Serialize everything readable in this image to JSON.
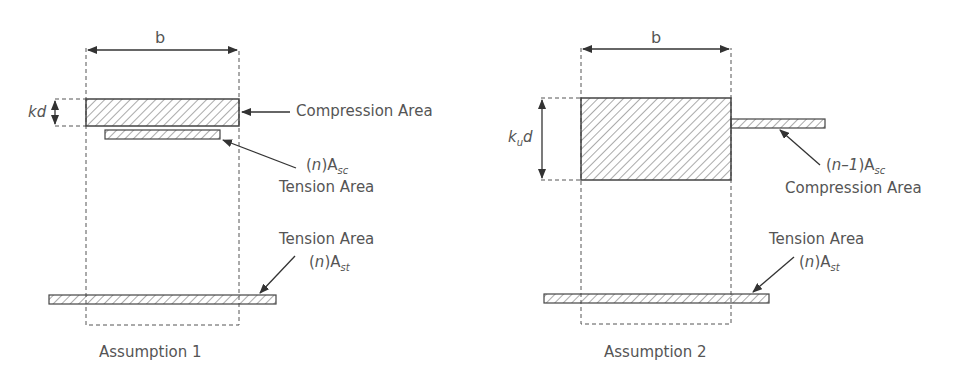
{
  "diagrams": [
    {
      "id": "assumption-1",
      "caption": "Assumption 1",
      "width_label": "b",
      "depth_label": {
        "base": "kd",
        "sub": ""
      },
      "annotations": [
        {
          "text": "Compression Area"
        },
        {
          "prefix": "(",
          "var": "n",
          "mid": ")A",
          "sub": "sc",
          "text": "Tension Area"
        },
        {
          "text": "Tension Area",
          "prefix": "(",
          "var": "n",
          "mid": ")A",
          "sub": "st"
        }
      ]
    },
    {
      "id": "assumption-2",
      "caption": "Assumption 2",
      "width_label": "b",
      "depth_label": {
        "base": "k",
        "sub": "u",
        "tail": "d"
      },
      "annotations": [
        {
          "prefix": "(",
          "var": "n–1",
          "mid": ")A",
          "sub": "sc",
          "text": "Compression Area"
        },
        {
          "text": "Tension Area",
          "prefix": "(",
          "var": "n",
          "mid": ")A",
          "sub": "st"
        }
      ]
    }
  ],
  "colors": {
    "stroke": "#444444",
    "text": "#555555",
    "background": "#ffffff"
  }
}
